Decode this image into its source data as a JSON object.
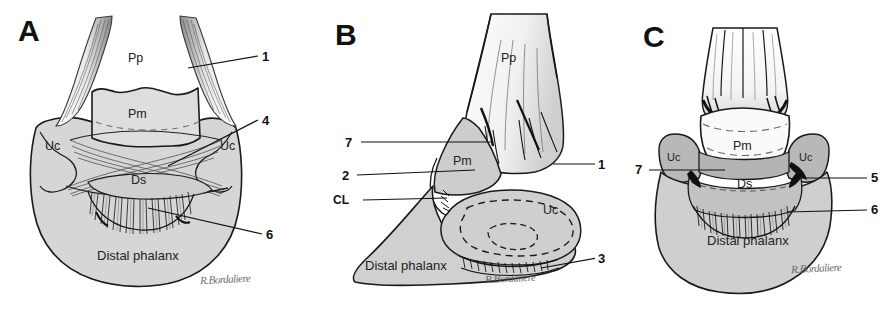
{
  "figure": {
    "background_color": "#ffffff",
    "bone_fill_color": "#d6d6d6",
    "bone_fill_dark": "#c4c4c4",
    "bone_fill_light": "#f2f2f2",
    "outline_color": "#1a1a1a",
    "text_color": "#111111"
  },
  "panels": [
    {
      "letter": "A",
      "view": "dorsal / palmar view",
      "bone_labels": [
        {
          "text": "Pp"
        },
        {
          "text": "Pm"
        },
        {
          "text": "Uc"
        },
        {
          "text": "Uc"
        },
        {
          "text": "Ds"
        },
        {
          "text": "Distal phalanx"
        }
      ],
      "leader_labels": [
        {
          "text": "1"
        },
        {
          "text": "4"
        },
        {
          "text": "6"
        }
      ],
      "signature": "R.Bordaliere"
    },
    {
      "letter": "B",
      "view": "lateral view",
      "bone_labels": [
        {
          "text": "Pp"
        },
        {
          "text": "Pm"
        },
        {
          "text": "Uc"
        },
        {
          "text": "Distal phalanx"
        }
      ],
      "leader_labels": [
        {
          "text": "7"
        },
        {
          "text": "2"
        },
        {
          "text": "CL"
        },
        {
          "text": "1"
        },
        {
          "text": "3"
        }
      ],
      "signature": "R.Bordaliere"
    },
    {
      "letter": "C",
      "view": "sagittal / sectioned view",
      "bone_labels": [
        {
          "text": "Uc"
        },
        {
          "text": "Pm"
        },
        {
          "text": "Uc"
        },
        {
          "text": "Ds"
        },
        {
          "text": "Distal phalanx"
        }
      ],
      "leader_labels": [
        {
          "text": "7"
        },
        {
          "text": "5"
        },
        {
          "text": "6"
        }
      ],
      "signature": "R.Bordaliere"
    }
  ]
}
